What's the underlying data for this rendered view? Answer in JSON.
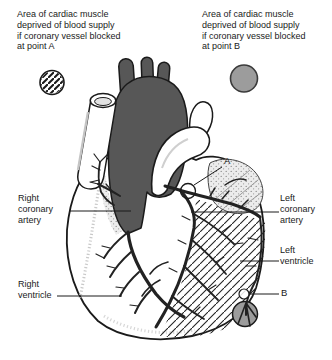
{
  "figure": {
    "legend_a": {
      "swatch": "hatched-circle",
      "lines": [
        "Area of cardiac muscle",
        "deprived of blood supply",
        "if coronary vessel blocked",
        "at point A"
      ]
    },
    "legend_b": {
      "swatch": "gray-circle",
      "lines": [
        "Area of cardiac muscle",
        "deprived of blood supply",
        "if coronary vessel blocked",
        "at point B"
      ]
    },
    "labels": {
      "right_coronary_artery": [
        "Right",
        "coronary",
        "artery"
      ],
      "right_ventricle": [
        "Right",
        "ventricle"
      ],
      "left_coronary_artery": [
        "Left",
        "coronary",
        "artery"
      ],
      "left_ventricle": [
        "Left",
        "ventricle"
      ],
      "point_a": "A",
      "point_b": "B"
    },
    "colors": {
      "aorta_gray": "#575757",
      "infarct_gray": "#9c9c9c",
      "line_black": "#1a1a1a"
    }
  }
}
